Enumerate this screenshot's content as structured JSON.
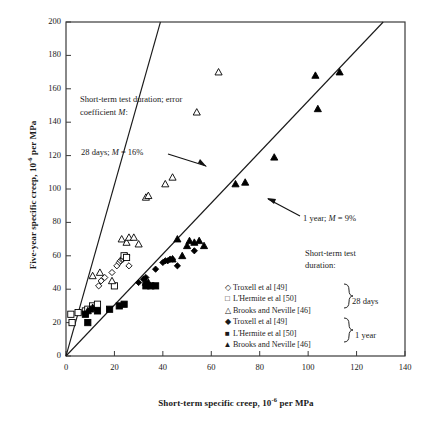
{
  "chart_data": {
    "type": "scatter",
    "title": "",
    "xlabel": "Short-term specific creep, 10-6 per MPa",
    "ylabel": "Five-year specific creep, 10-6 per MPa",
    "xlim": [
      0,
      140
    ],
    "ylim": [
      0,
      200
    ],
    "xticks": [
      0,
      20,
      40,
      60,
      80,
      100,
      120,
      140
    ],
    "yticks": [
      0,
      20,
      40,
      60,
      80,
      100,
      120,
      140,
      160,
      180,
      200
    ],
    "grid": false,
    "legend_position": "inside-bottom-right",
    "series": [
      {
        "name": "Troxell et al [49]",
        "marker": "open-diamond",
        "group": "28 days",
        "points": [
          [
            13.5,
            42
          ],
          [
            14.5,
            45
          ],
          [
            16,
            47
          ],
          [
            19,
            50
          ],
          [
            21,
            54
          ],
          [
            22,
            56
          ],
          [
            22.5,
            57
          ],
          [
            23,
            58
          ],
          [
            23.5,
            58
          ],
          [
            24,
            59
          ],
          [
            24.5,
            60
          ],
          [
            25,
            60
          ],
          [
            26,
            54
          ]
        ]
      },
      {
        "name": "L'Hermite et al [50]",
        "marker": "open-square",
        "group": "28 days",
        "points": [
          [
            2,
            25
          ],
          [
            2.5,
            20
          ],
          [
            5,
            26
          ],
          [
            8,
            27
          ],
          [
            9,
            28
          ],
          [
            11,
            30
          ],
          [
            13,
            31
          ],
          [
            20,
            42
          ],
          [
            24,
            60
          ],
          [
            25,
            59
          ]
        ]
      },
      {
        "name": "Brooks and Neville [46]",
        "marker": "open-triangle",
        "group": "28 days",
        "points": [
          [
            11,
            48
          ],
          [
            14,
            50
          ],
          [
            19,
            45
          ],
          [
            23,
            70
          ],
          [
            25,
            68
          ],
          [
            26,
            71
          ],
          [
            28,
            71
          ],
          [
            30,
            67
          ],
          [
            33,
            95
          ],
          [
            34,
            96
          ],
          [
            41,
            103
          ],
          [
            44,
            107
          ],
          [
            54,
            146
          ],
          [
            63,
            170
          ]
        ]
      },
      {
        "name": "Troxell et al [49]",
        "marker": "filled-diamond",
        "group": "1 year",
        "points": [
          [
            30,
            44
          ],
          [
            32,
            46
          ],
          [
            33,
            47
          ],
          [
            37,
            52
          ],
          [
            40,
            56
          ],
          [
            41,
            57
          ],
          [
            42,
            57
          ],
          [
            43,
            58
          ],
          [
            44,
            58
          ],
          [
            46,
            54
          ],
          [
            53,
            63
          ]
        ]
      },
      {
        "name": "L'Hermite et al [50]",
        "marker": "filled-square",
        "group": "1 year",
        "points": [
          [
            8,
            25
          ],
          [
            9,
            20
          ],
          [
            13,
            27
          ],
          [
            18,
            28
          ],
          [
            22,
            30
          ],
          [
            24,
            31
          ],
          [
            33,
            42
          ],
          [
            35,
            42
          ],
          [
            37,
            42
          ]
        ]
      },
      {
        "name": "Brooks and Neville [46]",
        "marker": "filled-triangle",
        "group": "1 year",
        "points": [
          [
            9,
            27
          ],
          [
            10,
            28
          ],
          [
            11,
            29
          ],
          [
            33,
            44
          ],
          [
            34,
            44
          ],
          [
            44,
            58
          ],
          [
            46,
            70
          ],
          [
            48,
            60
          ],
          [
            50,
            66
          ],
          [
            51,
            69
          ],
          [
            53,
            68
          ],
          [
            55,
            69
          ],
          [
            57,
            66
          ],
          [
            70,
            103
          ],
          [
            74,
            104
          ],
          [
            86,
            119
          ],
          [
            103,
            168
          ],
          [
            113,
            170
          ],
          [
            104,
            148
          ]
        ]
      }
    ],
    "fit_lines": [
      {
        "label": "28 days; M = 16%",
        "from": [
          0,
          0
        ],
        "to": [
          39,
          200
        ],
        "slope": 5.13
      },
      {
        "label": "1 year; M = 9%",
        "from": [
          0,
          0
        ],
        "to": [
          131,
          200
        ],
        "slope": 1.527
      }
    ],
    "annotations": [
      {
        "id": "header",
        "text_line1": "Short-term test duration; error",
        "text_line2": "coefficient M:"
      },
      {
        "id": "fit-28",
        "text": "28 days; M = 16%"
      },
      {
        "id": "fit-1y",
        "text": "1 year; M = 9%"
      }
    ]
  },
  "axes": {
    "y_title_pre": "Five-year specific creep, 10",
    "y_title_sup": "-6",
    "y_title_post": " per MPa",
    "x_title_pre": "Short-term specific creep, 10",
    "x_title_sup": "-6",
    "x_title_post": " per MPa",
    "yticks": [
      "0",
      "20",
      "40",
      "60",
      "80",
      "100",
      "120",
      "140",
      "160",
      "180",
      "200"
    ],
    "xticks": [
      "0",
      "20",
      "40",
      "60",
      "80",
      "100",
      "120",
      "140"
    ]
  },
  "annotations": {
    "header_line1": "Short-term test duration; error",
    "header_line2_pre": "coefficient ",
    "header_line2_italic": "M",
    "header_line2_post": ":",
    "fit28_pre": "28 days; ",
    "fit28_italic": "M",
    "fit28_post": " = 16%",
    "fit1y_pre": "1 year; ",
    "fit1y_italic": "M",
    "fit1y_post": " = 9%"
  },
  "legend": {
    "title_line1": "Short-term test",
    "title_line2": "duration:",
    "rows": [
      {
        "symbol": "◇",
        "label": "Troxell et al [49]"
      },
      {
        "symbol": "□",
        "label": "L'Hermite et al [50]"
      },
      {
        "symbol": "△",
        "label": "Brooks and Neville [46]"
      },
      {
        "symbol": "◆",
        "label": "Troxell et al [49]"
      },
      {
        "symbol": "■",
        "label": "L'Hermite et al [50]"
      },
      {
        "symbol": "▲",
        "label": "Brooks and Neville [46]"
      }
    ],
    "group_28": "28 days",
    "group_1y": "1 year"
  },
  "colors": {
    "axis": "#3a3a3a",
    "marker": "#000000",
    "fit_line": "#1a1a1a",
    "background": "#ffffff"
  }
}
